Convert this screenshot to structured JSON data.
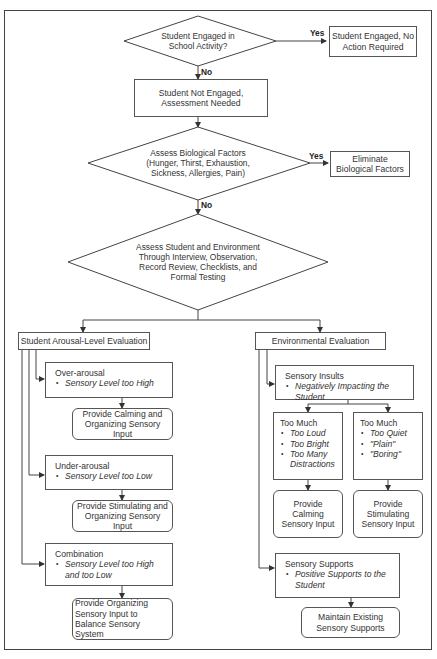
{
  "diagram": {
    "type": "flowchart",
    "nodes": {
      "engaged_q": {
        "text": "Student Engaged in School Activity?"
      },
      "engaged_yes": {
        "text": "Student Engaged, No Action Required"
      },
      "not_engaged": {
        "text": "Student Not Engaged, Assessment Needed"
      },
      "bio_q": {
        "text": "Assess Biological Factors (Hunger, Thirst, Exhaustion, Sickness, Allergies, Pain)"
      },
      "bio_yes": {
        "text": "Eliminate Biological Factors"
      },
      "assess": {
        "text": "Assess Student and Environment Through Interview, Observation, Record Review, Checklists, and Formal Testing"
      },
      "arousal_eval": {
        "text": "Student Arousal-Level Evaluation"
      },
      "over_arousal": {
        "title": "Over-arousal",
        "bullets": [
          "Sensory Level too High"
        ]
      },
      "over_action": {
        "text": "Provide Calming and Organizing Sensory Input"
      },
      "under_arousal": {
        "title": "Under-arousal",
        "bullets": [
          "Sensory Level too Low"
        ]
      },
      "under_action": {
        "text": "Provide Stimulating and Organizing Sensory Input"
      },
      "combination": {
        "title": "Combination",
        "bullets": [
          "Sensory Level too High and too Low"
        ]
      },
      "combination_action": {
        "text": "Provide Organizing Sensory Input to Balance Sensory System"
      },
      "env_eval": {
        "text": "Environmental Evaluation"
      },
      "sensory_insults": {
        "title": "Sensory Insults",
        "bullets": [
          "Negatively Impacting the Student"
        ]
      },
      "too_much_high": {
        "title": "Too Much",
        "bullets": [
          "Too Loud",
          "Too Bright",
          "Too Many Distractions"
        ]
      },
      "too_much_low": {
        "title": "Too Much",
        "bullets": [
          "Too Quiet",
          "\"Plain\"",
          "\"Boring\""
        ]
      },
      "calming_action": {
        "text": "Provide Calming Sensory Input"
      },
      "stimulating_action": {
        "text": "Provide Stimulating Sensory Input"
      },
      "sensory_supports": {
        "title": "Sensory Supports",
        "bullets": [
          "Positive Supports to the Student"
        ]
      },
      "supports_action": {
        "text": "Maintain Existing Sensory Supports"
      }
    },
    "edge_labels": {
      "yes1": "Yes",
      "no1": "No",
      "yes2": "Yes",
      "no2": "No"
    },
    "edges": [
      {
        "from": "engaged_q",
        "to": "engaged_yes",
        "label": "Yes"
      },
      {
        "from": "engaged_q",
        "to": "not_engaged",
        "label": "No"
      },
      {
        "from": "not_engaged",
        "to": "bio_q"
      },
      {
        "from": "bio_q",
        "to": "bio_yes",
        "label": "Yes"
      },
      {
        "from": "bio_q",
        "to": "assess",
        "label": "No"
      },
      {
        "from": "assess",
        "to": "arousal_eval"
      },
      {
        "from": "assess",
        "to": "env_eval"
      },
      {
        "from": "arousal_eval",
        "to": "over_arousal"
      },
      {
        "from": "over_arousal",
        "to": "over_action"
      },
      {
        "from": "arousal_eval",
        "to": "under_arousal"
      },
      {
        "from": "under_arousal",
        "to": "under_action"
      },
      {
        "from": "arousal_eval",
        "to": "combination"
      },
      {
        "from": "combination",
        "to": "combination_action"
      },
      {
        "from": "env_eval",
        "to": "sensory_insults"
      },
      {
        "from": "sensory_insults",
        "to": "too_much_high"
      },
      {
        "from": "sensory_insults",
        "to": "too_much_low"
      },
      {
        "from": "too_much_high",
        "to": "calming_action"
      },
      {
        "from": "too_much_low",
        "to": "stimulating_action"
      },
      {
        "from": "env_eval",
        "to": "sensory_supports"
      },
      {
        "from": "sensory_supports",
        "to": "supports_action"
      }
    ],
    "colors": {
      "line": "#444444",
      "background": "#ffffff",
      "text": "#333333"
    }
  }
}
